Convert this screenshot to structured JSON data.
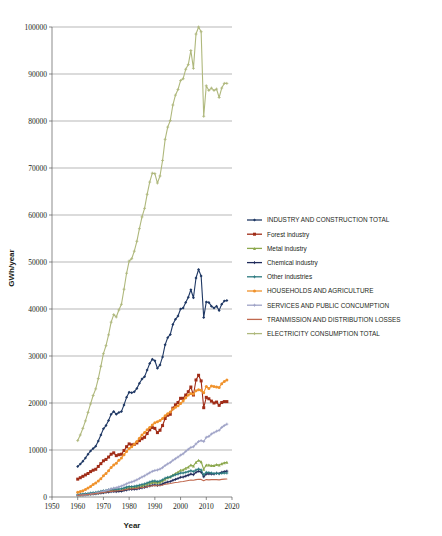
{
  "chart_data": {
    "type": "line",
    "title": "",
    "xlabel": "Year",
    "ylabel": "GWh/year",
    "xlim": [
      1950,
      2020
    ],
    "ylim": [
      0,
      100000
    ],
    "xticks": [
      "1950",
      "1960",
      "1970",
      "1980",
      "1990",
      "2000",
      "2010",
      "2020"
    ],
    "yticks": [
      "0",
      "10000",
      "20000",
      "30000",
      "40000",
      "50000",
      "60000",
      "70000",
      "80000",
      "90000",
      "100000"
    ],
    "grid": "horizontal",
    "legend_position": "right",
    "x": [
      1960,
      1961,
      1962,
      1963,
      1964,
      1965,
      1966,
      1967,
      1968,
      1969,
      1970,
      1971,
      1972,
      1973,
      1974,
      1975,
      1976,
      1977,
      1978,
      1979,
      1980,
      1981,
      1982,
      1983,
      1984,
      1985,
      1986,
      1987,
      1988,
      1989,
      1990,
      1991,
      1992,
      1993,
      1994,
      1995,
      1996,
      1997,
      1998,
      1999,
      2000,
      2001,
      2002,
      2003,
      2004,
      2005,
      2006,
      2007,
      2008,
      2009,
      2010,
      2011,
      2012,
      2013,
      2014,
      2015,
      2016,
      2017,
      2018
    ],
    "series": [
      {
        "name": "INDUSTRY AND CONSTRUCTION TOTAL",
        "color": "#1f3864",
        "marker": "diamond",
        "values": [
          6500,
          7000,
          7600,
          8300,
          9100,
          9800,
          10300,
          10800,
          11900,
          13200,
          14500,
          15200,
          16300,
          17600,
          18200,
          17600,
          18000,
          18200,
          19600,
          21200,
          22300,
          22200,
          22400,
          23100,
          24200,
          25100,
          25600,
          27000,
          28400,
          29300,
          29000,
          27400,
          28100,
          29800,
          32400,
          33900,
          34600,
          36700,
          37800,
          38500,
          40000,
          40200,
          41400,
          42500,
          44100,
          42400,
          46600,
          48400,
          47000,
          38200,
          41500,
          41400,
          40600,
          40200,
          40600,
          39700,
          41000,
          41700,
          41800
        ]
      },
      {
        "name": "Forest industry",
        "color": "#A02C17",
        "marker": "square",
        "values": [
          3800,
          4100,
          4400,
          4700,
          5000,
          5400,
          5700,
          5900,
          6500,
          7100,
          7700,
          8000,
          8500,
          9100,
          9400,
          8800,
          9000,
          9100,
          9900,
          10700,
          11300,
          11100,
          11200,
          11500,
          12000,
          12400,
          12700,
          13500,
          14300,
          14800,
          14600,
          13700,
          14200,
          15200,
          16700,
          17400,
          17600,
          18900,
          19600,
          20100,
          21000,
          21000,
          21700,
          22400,
          23400,
          21700,
          24900,
          25900,
          24700,
          19000,
          21200,
          20900,
          20400,
          20000,
          20200,
          19500,
          20100,
          20300,
          20300
        ]
      },
      {
        "name": "Metal industry",
        "color": "#8CA84E",
        "marker": "triangle",
        "values": [
          400,
          450,
          500,
          560,
          620,
          700,
          780,
          830,
          900,
          1000,
          1100,
          1180,
          1280,
          1400,
          1450,
          1400,
          1450,
          1500,
          1650,
          1800,
          1950,
          1950,
          2000,
          2100,
          2250,
          2400,
          2500,
          2700,
          2900,
          3100,
          3150,
          3000,
          3150,
          3400,
          3800,
          4100,
          4300,
          4700,
          5000,
          5300,
          5700,
          5800,
          6100,
          6400,
          6800,
          6600,
          7400,
          7800,
          7500,
          5900,
          6800,
          6800,
          6700,
          6700,
          6900,
          6800,
          7100,
          7300,
          7400
        ]
      },
      {
        "name": "Chemical industry",
        "color": "#1F2A5A",
        "marker": "plus",
        "values": [
          350,
          390,
          430,
          480,
          530,
          590,
          650,
          700,
          760,
          840,
          920,
          980,
          1060,
          1150,
          1200,
          1150,
          1200,
          1250,
          1370,
          1500,
          1600,
          1600,
          1650,
          1720,
          1830,
          1950,
          2050,
          2200,
          2350,
          2500,
          2550,
          2450,
          2560,
          2750,
          3020,
          3200,
          3300,
          3550,
          3750,
          3950,
          4200,
          4250,
          4450,
          4650,
          4900,
          4750,
          5250,
          5500,
          5300,
          4300,
          4900,
          4950,
          4900,
          4900,
          5050,
          5000,
          5250,
          5400,
          5500
        ]
      },
      {
        "name": "Other industries",
        "color": "#2C7A7F",
        "marker": "plus",
        "values": [
          500,
          560,
          620,
          690,
          760,
          840,
          920,
          980,
          1080,
          1200,
          1320,
          1400,
          1520,
          1650,
          1720,
          1650,
          1700,
          1760,
          1920,
          2100,
          2230,
          2220,
          2270,
          2370,
          2510,
          2670,
          2780,
          2980,
          3180,
          3370,
          3420,
          3270,
          3400,
          3650,
          4000,
          4180,
          4270,
          4550,
          4730,
          4880,
          5100,
          5100,
          5250,
          5400,
          5600,
          5400,
          5750,
          5950,
          5750,
          4750,
          5250,
          5200,
          5100,
          5000,
          5050,
          4950,
          5050,
          5100,
          5100
        ]
      },
      {
        "name": "HOUSEHOLDS AND AGRICULTURE",
        "color": "#F0922B",
        "marker": "circle",
        "values": [
          1000,
          1150,
          1350,
          1600,
          1900,
          2250,
          2650,
          3000,
          3400,
          3900,
          4500,
          5000,
          5600,
          6300,
          6800,
          7200,
          7800,
          8300,
          9000,
          9700,
          10300,
          10700,
          11200,
          11800,
          12500,
          13200,
          13700,
          14300,
          14800,
          15300,
          15800,
          16000,
          16300,
          16700,
          17300,
          17700,
          18100,
          18700,
          19100,
          19400,
          19900,
          20400,
          21100,
          21700,
          22000,
          21900,
          22600,
          22800,
          22700,
          22200,
          23500,
          23100,
          23600,
          23500,
          23400,
          23300,
          24100,
          24600,
          24900
        ]
      },
      {
        "name": "SERVICES AND PUBLIC CONCUMPTION",
        "color": "#9EA2C6",
        "marker": "plus",
        "values": [
          300,
          340,
          390,
          450,
          520,
          600,
          700,
          800,
          920,
          1060,
          1220,
          1350,
          1520,
          1720,
          1880,
          1980,
          2150,
          2320,
          2550,
          2800,
          3050,
          3200,
          3400,
          3650,
          3950,
          4250,
          4500,
          4850,
          5150,
          5450,
          5650,
          5750,
          5950,
          6250,
          6700,
          7050,
          7350,
          7800,
          8150,
          8500,
          8900,
          9200,
          9700,
          10150,
          10550,
          10700,
          11300,
          11800,
          12000,
          11800,
          12700,
          12900,
          13400,
          13700,
          14000,
          14200,
          14800,
          15200,
          15500
        ]
      },
      {
        "name": "TRANMISSION AND DISTRIBUTION LOSSES",
        "color": "#C0694F",
        "marker": "none",
        "values": [
          350,
          390,
          430,
          480,
          540,
          600,
          670,
          730,
          800,
          880,
          960,
          1020,
          1100,
          1190,
          1250,
          1270,
          1330,
          1390,
          1490,
          1600,
          1690,
          1720,
          1770,
          1840,
          1930,
          2020,
          2090,
          2190,
          2290,
          2380,
          2430,
          2400,
          2450,
          2550,
          2700,
          2800,
          2860,
          2980,
          3070,
          3140,
          3250,
          3300,
          3400,
          3500,
          3600,
          3560,
          3700,
          3780,
          3740,
          3450,
          3700,
          3650,
          3700,
          3700,
          3700,
          3650,
          3750,
          3800,
          3820
        ]
      },
      {
        "name": "ELECTRICITY CONSUMPTION TOTAL",
        "color": "#AFB87C",
        "marker": "plus",
        "values": [
          12000,
          13200,
          14600,
          16200,
          18000,
          19800,
          21600,
          23000,
          25200,
          27800,
          30500,
          32200,
          34500,
          37200,
          38800,
          38300,
          39800,
          41000,
          44200,
          47600,
          50200,
          50700,
          52300,
          54400,
          57100,
          59600,
          61400,
          64400,
          67000,
          68900,
          68800,
          66800,
          68300,
          71600,
          76100,
          78700,
          80100,
          83400,
          85500,
          86700,
          88600,
          89000,
          91000,
          92000,
          95000,
          91200,
          98500,
          100000,
          99000,
          81000,
          87500,
          86500,
          87000,
          86500,
          86800,
          85000,
          87000,
          88000,
          88000
        ]
      }
    ]
  },
  "axis": {
    "y_title": "GWh/year",
    "x_title": "Year"
  }
}
